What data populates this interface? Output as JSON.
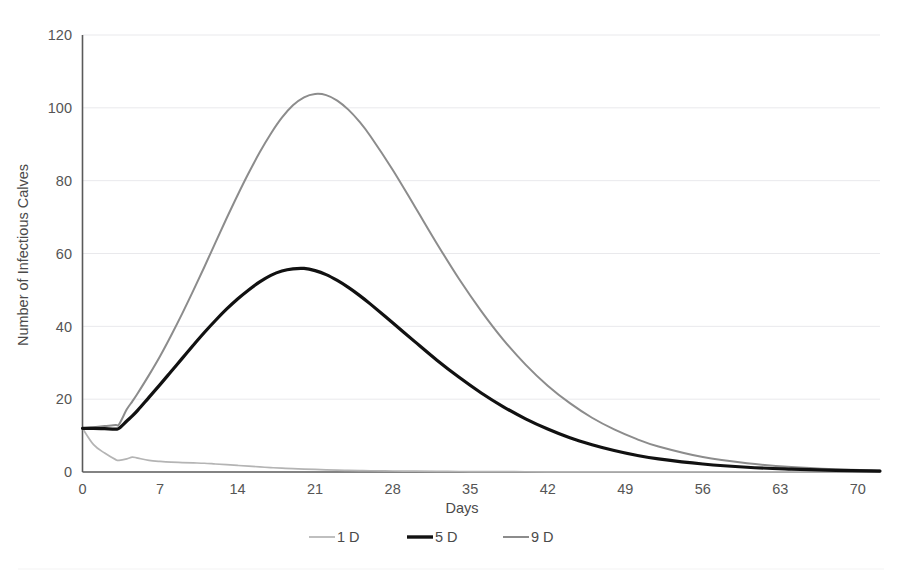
{
  "chart_data": {
    "type": "line",
    "title": "",
    "xlabel": "Days",
    "ylabel": "Number of Infectious Calves",
    "xlim": [
      0,
      72
    ],
    "ylim": [
      0,
      120
    ],
    "xticks": [
      "0",
      "7",
      "14",
      "21",
      "28",
      "35",
      "42",
      "49",
      "56",
      "63",
      "70"
    ],
    "xtick_values": [
      0,
      7,
      14,
      21,
      28,
      35,
      42,
      49,
      56,
      63,
      70
    ],
    "yticks": [
      "0",
      "20",
      "40",
      "60",
      "80",
      "100",
      "120"
    ],
    "ytick_values": [
      0,
      20,
      40,
      60,
      80,
      100,
      120
    ],
    "grid": "horizontal",
    "legend_position": "bottom",
    "x": [
      0,
      1,
      2,
      3,
      3.3,
      4,
      4.5,
      5,
      6,
      7,
      8,
      9,
      10,
      11,
      12,
      13,
      14,
      15,
      16,
      17,
      18,
      19,
      20,
      21,
      22,
      23,
      24,
      25,
      26,
      28,
      30,
      32,
      34,
      36,
      38,
      40,
      42,
      44,
      46,
      48,
      50,
      52,
      56,
      60,
      64,
      68,
      72
    ],
    "series": [
      {
        "name": "1 D",
        "color": "#b4b4b4",
        "stroke_width": 1.7,
        "values": [
          12,
          7.5,
          5.2,
          3.4,
          3.2,
          3.6,
          4.1,
          3.8,
          3.2,
          2.9,
          2.7,
          2.6,
          2.5,
          2.4,
          2.2,
          2.0,
          1.8,
          1.6,
          1.4,
          1.2,
          1.05,
          0.9,
          0.8,
          0.7,
          0.6,
          0.5,
          0.45,
          0.4,
          0.35,
          0.28,
          0.22,
          0.18,
          0.14,
          0.11,
          0.09,
          0.07,
          0.06,
          0.05,
          0.04,
          0.03,
          0.03,
          0.02,
          0.02,
          0.01,
          0.01,
          0.01,
          0
        ]
      },
      {
        "name": "5 D",
        "color": "#111111",
        "stroke_width": 3.2,
        "values": [
          12,
          12,
          11.9,
          11.8,
          12.0,
          14.0,
          15.4,
          17.0,
          20.5,
          24.0,
          27.6,
          31.2,
          34.8,
          38.3,
          41.6,
          44.7,
          47.5,
          50.0,
          52.2,
          54.0,
          55.2,
          55.8,
          55.9,
          55.3,
          54.2,
          52.6,
          50.7,
          48.5,
          46.1,
          41.0,
          35.8,
          30.7,
          26.0,
          21.7,
          17.9,
          14.6,
          11.8,
          9.4,
          7.5,
          5.9,
          4.6,
          3.6,
          2.2,
          1.3,
          0.8,
          0.45,
          0.25
        ]
      },
      {
        "name": "9 D",
        "color": "#8c8c8c",
        "stroke_width": 2.0,
        "values": [
          12,
          12.3,
          12.6,
          12.9,
          13.1,
          17.2,
          19.4,
          21.7,
          26.6,
          31.8,
          37.5,
          43.5,
          49.8,
          56.3,
          63.0,
          69.6,
          76.0,
          82.1,
          87.8,
          92.9,
          97.3,
          100.7,
          102.9,
          103.8,
          103.5,
          102.0,
          99.5,
          96.2,
          92.2,
          83.0,
          72.9,
          62.7,
          53.0,
          44.2,
          36.3,
          29.5,
          23.7,
          18.9,
          14.9,
          11.7,
          9.1,
          7.0,
          4.1,
          2.4,
          1.35,
          0.75,
          0.4
        ]
      }
    ],
    "legend": [
      {
        "label": "1 D",
        "color": "#b4b4b4",
        "stroke_width": 1.7
      },
      {
        "label": "5 D",
        "color": "#111111",
        "stroke_width": 3.4
      },
      {
        "label": "9 D",
        "color": "#8c8c8c",
        "stroke_width": 2.0
      }
    ]
  }
}
